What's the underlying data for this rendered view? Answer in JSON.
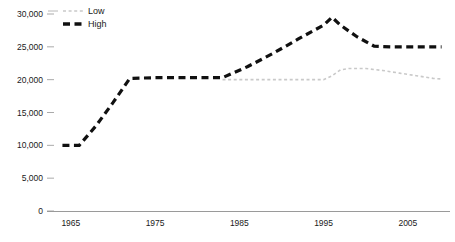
{
  "chart_data": {
    "type": "line",
    "title": "",
    "xlabel": "",
    "ylabel": "",
    "grid": false,
    "legend_position": "top-left",
    "xlim": [
      1963,
      2010
    ],
    "ylim": [
      0,
      30000
    ],
    "x_ticks": [
      1965,
      1975,
      1985,
      1995,
      2005
    ],
    "x_tick_labels": [
      "1965",
      "1975",
      "1985",
      "1995",
      "2005"
    ],
    "y_ticks": [
      0,
      5000,
      10000,
      15000,
      20000,
      25000,
      30000
    ],
    "y_tick_labels": [
      "0",
      "5,000",
      "10,000",
      "15,000",
      "20,000",
      "25,000",
      "30,000"
    ],
    "series": [
      {
        "name": "Low",
        "color": "#c9c9c9",
        "style": "fine-dashed",
        "x": [
          1983,
          1985,
          1990,
          1995,
          1996,
          1997,
          1998,
          2000,
          2002,
          2004,
          2006,
          2008,
          2009
        ],
        "values": [
          20000,
          20000,
          20000,
          20000,
          20600,
          21500,
          21700,
          21700,
          21400,
          21000,
          20600,
          20200,
          20100
        ]
      },
      {
        "name": "High",
        "color": "#101010",
        "style": "bold-dashed",
        "x": [
          1964,
          1966,
          1968,
          1970,
          1972,
          1975,
          1980,
          1983,
          1986,
          1989,
          1992,
          1995,
          1996,
          1997,
          1999,
          2001,
          2003,
          2005,
          2007,
          2009
        ],
        "values": [
          10000,
          10000,
          13000,
          16500,
          20200,
          20300,
          20300,
          20300,
          22000,
          24000,
          26200,
          28300,
          29500,
          28300,
          26500,
          25100,
          25000,
          25000,
          25000,
          25000
        ]
      }
    ]
  },
  "legend": {
    "items": [
      {
        "label": "Low",
        "color": "#c9c9c9"
      },
      {
        "label": "High",
        "color": "#101010"
      }
    ]
  }
}
